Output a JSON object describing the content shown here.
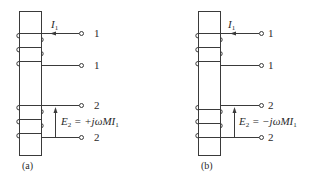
{
  "diagram": {
    "type": "coupled-coils-mutual-inductance",
    "colors": {
      "line": "#3a3a3a",
      "background": "#ffffff"
    },
    "panels": [
      {
        "id": "a",
        "caption": "(a)",
        "current_label": "I",
        "current_sub": "1",
        "terminals": [
          "1",
          "1",
          "2",
          "2"
        ],
        "emf_label_main": "E",
        "emf_label_sub": "2",
        "emf_expr": " = +jωMI",
        "emf_expr_sub": "1"
      },
      {
        "id": "b",
        "caption": "(b)",
        "current_label": "I",
        "current_sub": "1",
        "terminals": [
          "1",
          "1",
          "2",
          "2"
        ],
        "emf_label_main": "E",
        "emf_label_sub": "2",
        "emf_expr": " = −jωMI",
        "emf_expr_sub": "1"
      }
    ]
  }
}
